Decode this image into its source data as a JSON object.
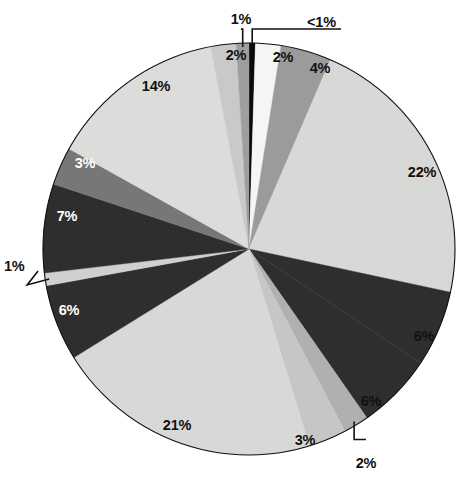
{
  "chart_data": {
    "type": "pie",
    "title": "",
    "subtitle": "",
    "xlabel": "",
    "ylabel": "",
    "legend": "none",
    "grid": false,
    "start_angle_deg": 0,
    "direction": "clockwise",
    "center": {
      "x": 249,
      "y": 249
    },
    "radius": 206,
    "categories": [
      "slice-1",
      "slice-2",
      "slice-3",
      "slice-4",
      "slice-5",
      "slice-6",
      "slice-7",
      "slice-8",
      "slice-9",
      "slice-10",
      "slice-11",
      "slice-12",
      "slice-13",
      "slice-14",
      "slice-15",
      "slice-16"
    ],
    "values": [
      0.5,
      2,
      4,
      22,
      6,
      6,
      2,
      3,
      21,
      6,
      1,
      7,
      3,
      14,
      2,
      1
    ],
    "labels": [
      "<1%",
      "2%",
      "4%",
      "22%",
      "6%",
      "6%",
      "2%",
      "3%",
      "21%",
      "6%",
      "1%",
      "7%",
      "3%",
      "14%",
      "2%",
      "1%"
    ],
    "colors": [
      "#0b0b0b",
      "#f5f5f3",
      "#9b9b9b",
      "#d8d8d6",
      "#2e2e2e",
      "#2e2e2e",
      "#b0b0b0",
      "#c6c6c4",
      "#d8d8d6",
      "#2e2e2e",
      "#d0d0ce",
      "#2e2e2e",
      "#777777",
      "#dcdcda",
      "#c9c9c7",
      "#9e9e9e"
    ],
    "label_positions": [
      {
        "x": 307,
        "y": 22,
        "anchor": "start",
        "leader": true
      },
      {
        "x": 283,
        "y": 57,
        "anchor": "middle",
        "leader": false
      },
      {
        "x": 320,
        "y": 68,
        "anchor": "middle",
        "leader": false
      },
      {
        "x": 422,
        "y": 172,
        "anchor": "middle",
        "leader": false
      },
      {
        "x": 424,
        "y": 336,
        "anchor": "middle",
        "leader": false
      },
      {
        "x": 371,
        "y": 401,
        "anchor": "middle",
        "leader": false
      },
      {
        "x": 366,
        "y": 463,
        "anchor": "middle",
        "leader": true
      },
      {
        "x": 305,
        "y": 440,
        "anchor": "middle",
        "leader": false
      },
      {
        "x": 177,
        "y": 425,
        "anchor": "middle",
        "leader": false
      },
      {
        "x": 69,
        "y": 310,
        "anchor": "middle",
        "leader": false
      },
      {
        "x": 4,
        "y": 266,
        "anchor": "start",
        "leader": true
      },
      {
        "x": 67,
        "y": 216,
        "anchor": "middle",
        "leader": false
      },
      {
        "x": 85,
        "y": 163,
        "anchor": "middle",
        "leader": false
      },
      {
        "x": 156,
        "y": 86,
        "anchor": "middle",
        "leader": false
      },
      {
        "x": 236,
        "y": 55,
        "anchor": "middle",
        "leader": false
      },
      {
        "x": 241,
        "y": 19,
        "anchor": "middle",
        "leader": true
      }
    ],
    "label_text_colors": [
      "#111111",
      "#111111",
      "#111111",
      "#111111",
      "#111111",
      "#111111",
      "#111111",
      "#111111",
      "#111111",
      "#ffffff",
      "#111111",
      "#ffffff",
      "#ffffff",
      "#111111",
      "#111111",
      "#111111"
    ]
  },
  "figure": {
    "background": "#ffffff",
    "outline_color": "#111111"
  }
}
